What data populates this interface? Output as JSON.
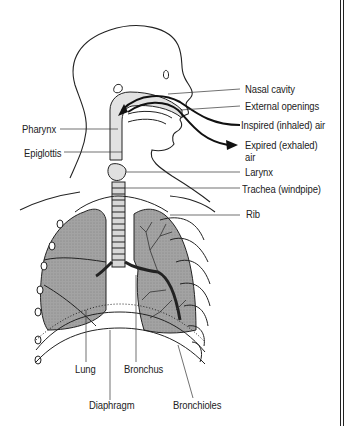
{
  "diagram": {
    "labels": {
      "nasal_cavity": "Nasal cavity",
      "external_openings": "External openings",
      "inspired_air": "Inspired (inhaled) air",
      "expired_air_line1": "Expired (exhaled)",
      "expired_air_line2": "air",
      "pharynx": "Pharynx",
      "epiglottis": "Epiglottis",
      "larynx": "Larynx",
      "trachea": "Trachea (windpipe)",
      "rib": "Rib",
      "lung": "Lung",
      "bronchus": "Bronchus",
      "diaphragm": "Diaphragm",
      "bronchioles": "Bronchioles"
    },
    "colors": {
      "lung_fill": "#9a9a9a",
      "airway_fill": "#e2e2e2",
      "line": "#222222",
      "background": "#ffffff"
    }
  }
}
